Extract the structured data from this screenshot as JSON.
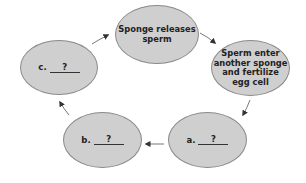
{
  "diagram": {
    "type": "cycle",
    "title": "",
    "nodes": [
      {
        "id": "top",
        "text": "Sponge releases\nsperm"
      },
      {
        "id": "right",
        "text": "Sperm enter\nanother sponge\nand fertilize\negg cell"
      },
      {
        "id": "a",
        "letter": "a.",
        "blank": "?"
      },
      {
        "id": "b",
        "letter": "b.",
        "blank": "?"
      },
      {
        "id": "c",
        "letter": "c.",
        "blank": "?"
      }
    ],
    "edges": [
      {
        "from": "top",
        "to": "right"
      },
      {
        "from": "right",
        "to": "a"
      },
      {
        "from": "a",
        "to": "b"
      },
      {
        "from": "b",
        "to": "c"
      },
      {
        "from": "c",
        "to": "top"
      }
    ],
    "colors": {
      "node_fill": "#cfcfcf",
      "node_border": "#8a8a8a",
      "arrow": "#333333",
      "background": "#ffffff"
    }
  }
}
